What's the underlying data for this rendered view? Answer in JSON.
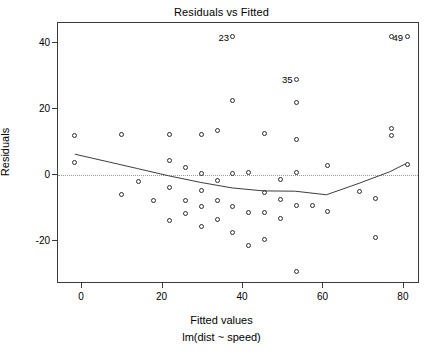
{
  "chart_data": {
    "type": "scatter",
    "title": "Residuals vs Fitted",
    "xlabel": "Fitted values",
    "sublabel": "lm(dist ~ speed)",
    "ylabel": "Residuals",
    "xlim": [
      -6,
      84
    ],
    "ylim": [
      -33,
      46
    ],
    "xticks": [
      0,
      20,
      40,
      60,
      80
    ],
    "yticks": [
      -20,
      0,
      20,
      40
    ],
    "grid": false,
    "legend": null,
    "zero_reference_line": 0,
    "points": [
      {
        "x": -1.8,
        "y": 3.8
      },
      {
        "x": -1.8,
        "y": 11.8
      },
      {
        "x": 9.9,
        "y": -5.9
      },
      {
        "x": 9.9,
        "y": 12.1
      },
      {
        "x": 13.9,
        "y": -1.9
      },
      {
        "x": 17.8,
        "y": -7.8
      },
      {
        "x": 21.7,
        "y": -3.7
      },
      {
        "x": 21.7,
        "y": 4.3
      },
      {
        "x": 21.7,
        "y": 12.3
      },
      {
        "x": 21.7,
        "y": -13.7
      },
      {
        "x": 25.7,
        "y": -11.7
      },
      {
        "x": 25.7,
        "y": -7.7
      },
      {
        "x": 25.7,
        "y": 2.3
      },
      {
        "x": 29.6,
        "y": -15.6
      },
      {
        "x": 29.6,
        "y": -9.6
      },
      {
        "x": 29.6,
        "y": -4.6
      },
      {
        "x": 29.6,
        "y": 0.4
      },
      {
        "x": 29.6,
        "y": 12.4
      },
      {
        "x": 33.6,
        "y": -13.6
      },
      {
        "x": 33.6,
        "y": -7.6
      },
      {
        "x": 33.6,
        "y": -1.6
      },
      {
        "x": 33.6,
        "y": 13.4
      },
      {
        "x": 37.5,
        "y": -17.5
      },
      {
        "x": 37.5,
        "y": -9.5
      },
      {
        "x": 37.5,
        "y": 0.5
      },
      {
        "x": 37.5,
        "y": 22.5
      },
      {
        "x": 37.5,
        "y": 41.8
      },
      {
        "x": 41.4,
        "y": -21.4
      },
      {
        "x": 41.4,
        "y": -11.4
      },
      {
        "x": 41.4,
        "y": 0.6
      },
      {
        "x": 45.4,
        "y": -19.4
      },
      {
        "x": 45.4,
        "y": -11.4
      },
      {
        "x": 45.4,
        "y": -5.4
      },
      {
        "x": 45.4,
        "y": 12.6
      },
      {
        "x": 49.3,
        "y": -13.3
      },
      {
        "x": 49.3,
        "y": -7.3
      },
      {
        "x": 49.3,
        "y": -1.3
      },
      {
        "x": 53.3,
        "y": -29.3
      },
      {
        "x": 53.3,
        "y": -9.3
      },
      {
        "x": 53.3,
        "y": 0.7
      },
      {
        "x": 53.3,
        "y": 10.7
      },
      {
        "x": 53.3,
        "y": 22.0
      },
      {
        "x": 53.3,
        "y": 29.0
      },
      {
        "x": 57.2,
        "y": -9.2
      },
      {
        "x": 61.1,
        "y": -11.1
      },
      {
        "x": 61.1,
        "y": 2.9
      },
      {
        "x": 69.0,
        "y": -5.0
      },
      {
        "x": 72.9,
        "y": -19.0
      },
      {
        "x": 72.9,
        "y": -7.0
      },
      {
        "x": 76.9,
        "y": 14.0
      },
      {
        "x": 76.9,
        "y": 12.0
      },
      {
        "x": 76.9,
        "y": 41.8
      },
      {
        "x": 80.8,
        "y": 3.2
      },
      {
        "x": 80.8,
        "y": 41.8
      }
    ],
    "labeled_points": [
      {
        "label": "23",
        "x": 37.5,
        "y": 41.8
      },
      {
        "label": "35",
        "x": 53.3,
        "y": 29.0
      },
      {
        "label": "49",
        "x": 80.8,
        "y": 41.8
      },
      {
        "label": "",
        "x": 76.9,
        "y": 13.0
      }
    ],
    "smooth_line": [
      {
        "x": -1.8,
        "y": 6.0
      },
      {
        "x": 6.0,
        "y": 3.8
      },
      {
        "x": 13.9,
        "y": 1.6
      },
      {
        "x": 21.7,
        "y": -0.6
      },
      {
        "x": 29.6,
        "y": -2.6
      },
      {
        "x": 37.5,
        "y": -4.3
      },
      {
        "x": 45.4,
        "y": -5.2
      },
      {
        "x": 53.3,
        "y": -5.3
      },
      {
        "x": 61.1,
        "y": -6.4
      },
      {
        "x": 69.0,
        "y": -3.0
      },
      {
        "x": 76.9,
        "y": 0.6
      },
      {
        "x": 80.8,
        "y": 3.0
      }
    ]
  }
}
